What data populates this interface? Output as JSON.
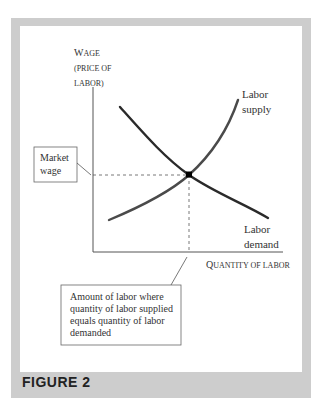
{
  "figure": {
    "label": "FIGURE 2"
  },
  "axes": {
    "y_label_first_letter": "W",
    "y_label_rest": "AGE",
    "y_label_line2": "(PRICE OF",
    "y_label_line3": "LABOR)",
    "x_label_first_letter": "Q",
    "x_label_rest": "UANTITY OF LABOR"
  },
  "curves": {
    "supply": {
      "label_line1": "Labor",
      "label_line2": "supply",
      "color": "#4a4a4a"
    },
    "demand": {
      "label_line1": "Labor",
      "label_line2": "demand",
      "color": "#2a2a2a"
    }
  },
  "callouts": {
    "market_wage": {
      "line1": "Market",
      "line2": "wage"
    },
    "equilibrium_quantity": {
      "line1": "Amount of labor where",
      "line2": "quantity of labor supplied",
      "line3": "equals quantity of labor",
      "line4": "demanded"
    }
  },
  "colors": {
    "frame": "#cdcdcd",
    "axis": "#555555",
    "text": "#333333"
  }
}
